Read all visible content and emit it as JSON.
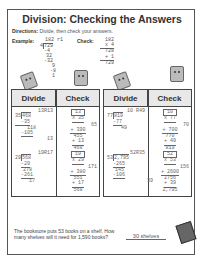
{
  "title": "Division: Checking the Answers",
  "directions": {
    "label": "Directions:",
    "text": "Divide, then check your answers."
  },
  "example": {
    "label": "Example:",
    "division": {
      "quotient": "182 r1",
      "divisor": "4",
      "dividend": "729",
      "steps": [
        "-4",
        "32",
        "-32",
        "9",
        "-8",
        "1"
      ]
    },
    "check_label": "Check:",
    "check": {
      "lines": [
        "182",
        "x 4",
        "728",
        "+ 1",
        "729"
      ]
    }
  },
  "tables": [
    {
      "headers": [
        "Divide",
        "Check"
      ],
      "rows": [
        {
          "divide": {
            "quotient": "13R13",
            "divisor": "35",
            "dividend": "468",
            "steps": [
              "-35",
              "118",
              "-105",
              "13"
            ]
          },
          "check": {
            "boxed": "13",
            "lines": [
              "x 35",
              "65",
              "+ 390",
              "455",
              "+ 13",
              "468"
            ]
          }
        },
        {
          "divide": {
            "quotient": "19R17",
            "divisor": "29",
            "dividend": "568",
            "steps": [
              "-29",
              "278",
              "-261",
              "17"
            ]
          },
          "check": {
            "boxed": "19",
            "lines": [
              "x 29",
              "171",
              "+ 380",
              "551",
              "+ 17",
              "568"
            ]
          }
        }
      ]
    },
    {
      "headers": [
        "Divide",
        "Check"
      ],
      "rows": [
        {
          "divide": {
            "quotient": "10 R49",
            "divisor": "77",
            "dividend": "819",
            "steps": [
              "-77",
              "49"
            ]
          },
          "check": {
            "boxed": "10",
            "lines": [
              "x 77",
              "70",
              "+ 700",
              "770",
              "+ 49",
              "819"
            ]
          }
        },
        {
          "divide": {
            "quotient": "52R35",
            "divisor": "53",
            "dividend": "2,795",
            "steps": [
              "-265",
              "145",
              "-106",
              "39"
            ]
          },
          "check": {
            "boxed": "52",
            "lines": [
              "x 53",
              "156",
              "+ 2600",
              "2756",
              "+ 39",
              "2,795"
            ]
          }
        }
      ]
    }
  ],
  "word_problem": {
    "text": "The bookstore puts 53 books on a shelf. How many shelves will it need for 1,590 books?",
    "answer": "30 shelves"
  }
}
